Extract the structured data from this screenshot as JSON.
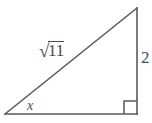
{
  "figure": {
    "type": "right-triangle-diagram",
    "background_color": "#ffffff",
    "stroke_color": "#5a5a5a",
    "text_color": "#4a4a4a",
    "labels": {
      "hypotenuse_radical": "√",
      "hypotenuse_radicand": "11",
      "hypotenuse_full": "√11",
      "vertical_leg": "2",
      "angle": "x"
    },
    "geometry": {
      "vertex_left": [
        5,
        114
      ],
      "vertex_top_right": [
        137,
        8
      ],
      "vertex_bottom_right": [
        137,
        114
      ],
      "right_angle_marker": {
        "x": 124,
        "y": 101,
        "size": 13
      }
    }
  }
}
